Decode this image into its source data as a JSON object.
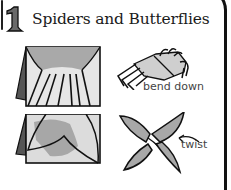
{
  "step": {
    "number": "1",
    "title": "Spiders and Butterflies"
  },
  "illustrations": [
    {
      "id": "folded-paper-fringe",
      "description": "folded paper with cut fringe strips"
    },
    {
      "id": "spider",
      "description": "spider folded from fringed paper",
      "label": "bend down"
    },
    {
      "id": "folded-paper-petal",
      "description": "folded paper with curved wing cut line"
    },
    {
      "id": "butterfly",
      "description": "butterfly with four wings",
      "label": "twist"
    }
  ],
  "colors": {
    "ink": "#111111",
    "paper_shade": "#b8b8b8",
    "paper_dark": "#555555",
    "text": "#1a1a1a",
    "label": "#444444"
  }
}
